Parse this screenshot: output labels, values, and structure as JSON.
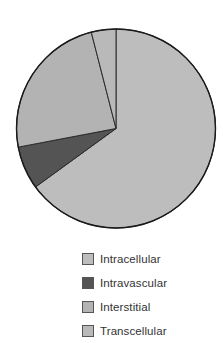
{
  "chart_data": {
    "type": "pie",
    "title": "",
    "start_angle_deg": 0,
    "direction": "clockwise",
    "categories": [
      "Intracellular",
      "Intravascular",
      "Interstitial",
      "Transcellular"
    ],
    "values": [
      65,
      7,
      24,
      4
    ],
    "colors": [
      "#bdbdbd",
      "#545454",
      "#b3b3b3",
      "#b9b9b9"
    ],
    "legend_position": "bottom",
    "data_labels": false
  },
  "legend": {
    "items": [
      {
        "label": "Intracellular",
        "color": "#bdbdbd"
      },
      {
        "label": "Intravascular",
        "color": "#545454"
      },
      {
        "label": "Interstitial",
        "color": "#b3b3b3"
      },
      {
        "label": "Transcellular",
        "color": "#b9b9b9"
      }
    ]
  }
}
